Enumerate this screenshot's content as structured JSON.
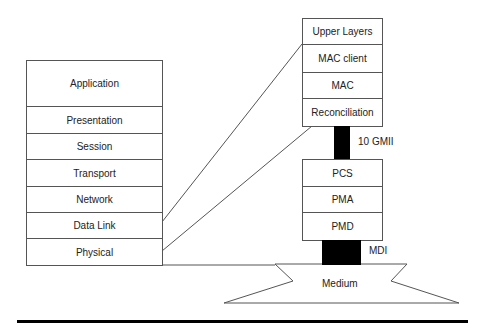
{
  "osi_stack": {
    "layers": [
      "Application",
      "Presentation",
      "Session",
      "Transport",
      "Network",
      "Data Link",
      "Physical"
    ]
  },
  "ethernet_stack": {
    "upper": [
      "Upper Layers",
      "MAC client",
      "MAC",
      "Reconciliation"
    ],
    "lower": [
      "PCS",
      "PMA",
      "PMD"
    ]
  },
  "interfaces": {
    "gmii": "10 GMII",
    "mdi": "MDI"
  },
  "medium": {
    "label": "Medium"
  }
}
